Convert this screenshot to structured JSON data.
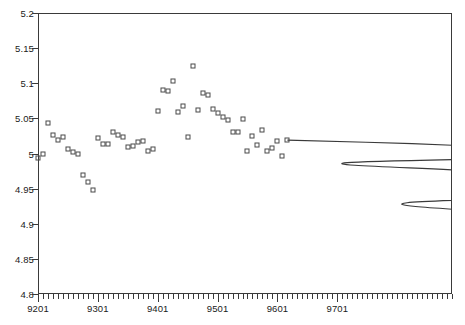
{
  "chart_data": {
    "type": "scatter",
    "title": "",
    "subtitle": "",
    "xlabel": "",
    "ylabel": "",
    "xlim": [
      9201,
      9812
    ],
    "ylim": [
      4.8,
      5.2
    ],
    "grid": false,
    "legend": null,
    "x_tick_labels": [
      "9201",
      "9301",
      "9401",
      "9501",
      "9601",
      "9701"
    ],
    "x_tick_values": [
      9201,
      9301,
      9401,
      9501,
      9601,
      9701
    ],
    "x_minor_tick_interval": 1,
    "y_tick_labels": [
      "4.8",
      "4.85",
      "4.9",
      "4.95",
      "5",
      "5.05",
      "5.1",
      "5.15",
      "5.2"
    ],
    "y_tick_values": [
      4.8,
      4.85,
      4.9,
      4.95,
      5.0,
      5.05,
      5.1,
      5.15,
      5.2
    ],
    "series": [
      {
        "name": "observed",
        "type": "scatter",
        "marker": "open-square",
        "color": "#4a4a4a",
        "points": [
          [
            9201,
            4.993
          ],
          [
            9202,
            4.999
          ],
          [
            9203,
            5.043
          ],
          [
            9204,
            5.027
          ],
          [
            9205,
            5.019
          ],
          [
            9206,
            5.024
          ],
          [
            9207,
            5.006
          ],
          [
            9208,
            5.002
          ],
          [
            9209,
            5.0
          ],
          [
            9210,
            4.97
          ],
          [
            9211,
            4.96
          ],
          [
            9212,
            4.948
          ],
          [
            9301,
            5.022
          ],
          [
            9302,
            5.013
          ],
          [
            9303,
            5.014
          ],
          [
            9304,
            5.03
          ],
          [
            9305,
            5.026
          ],
          [
            9306,
            5.024
          ],
          [
            9307,
            5.009
          ],
          [
            9308,
            5.011
          ],
          [
            9309,
            5.017
          ],
          [
            9310,
            5.018
          ],
          [
            9311,
            5.003
          ],
          [
            9312,
            5.006
          ],
          [
            9401,
            5.061
          ],
          [
            9402,
            5.09
          ],
          [
            9403,
            5.089
          ],
          [
            9404,
            5.103
          ],
          [
            9405,
            5.059
          ],
          [
            9406,
            5.068
          ],
          [
            9407,
            5.024
          ],
          [
            9408,
            5.125
          ],
          [
            9409,
            5.062
          ],
          [
            9410,
            5.086
          ],
          [
            9411,
            5.083
          ],
          [
            9412,
            5.064
          ],
          [
            9501,
            5.058
          ],
          [
            9502,
            5.052
          ],
          [
            9503,
            5.047
          ],
          [
            9504,
            5.03
          ],
          [
            9505,
            5.03
          ],
          [
            9506,
            5.049
          ],
          [
            9507,
            5.003
          ],
          [
            9508,
            5.025
          ],
          [
            9509,
            5.012
          ],
          [
            9510,
            5.033
          ],
          [
            9511,
            5.003
          ],
          [
            9512,
            5.008
          ],
          [
            9513,
            5.018
          ],
          [
            9514,
            4.997
          ],
          [
            9515,
            5.019
          ]
        ]
      },
      {
        "name": "forecast",
        "type": "line",
        "color": "#3a3a3a",
        "points": [
          [
            9515,
            5.019
          ],
          [
            9540,
            5.014
          ],
          [
            9565,
            5.007
          ],
          [
            9590,
            4.998
          ],
          [
            9615,
            4.987
          ],
          [
            9640,
            4.975
          ],
          [
            9665,
            4.961
          ],
          [
            9690,
            4.946
          ],
          [
            9715,
            4.93
          ],
          [
            9740,
            4.913
          ],
          [
            9765,
            4.895
          ],
          [
            9790,
            4.878
          ]
        ]
      }
    ]
  }
}
